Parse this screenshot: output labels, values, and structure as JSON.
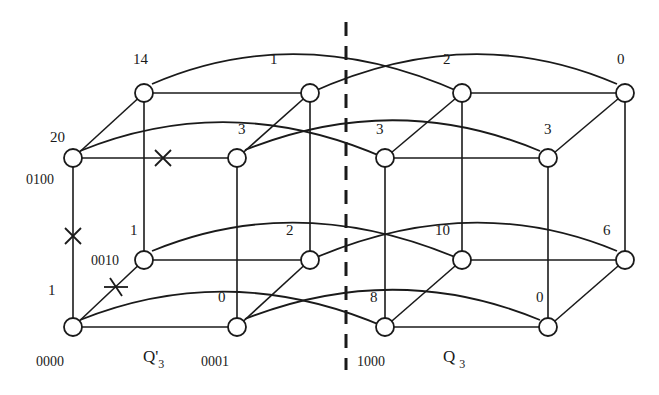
{
  "diagram": {
    "cubes": [
      {
        "label": "Q'",
        "subscript": "3"
      },
      {
        "label": "Q",
        "subscript": "3"
      }
    ],
    "node_values": {
      "back_top": [
        "14",
        "1",
        "2",
        "0"
      ],
      "front_top": [
        "20",
        "3",
        "3",
        "3"
      ],
      "back_bottom": [
        "1",
        "2",
        "10",
        "6"
      ],
      "front_bottom": [
        "1",
        "0",
        "8",
        "0"
      ]
    },
    "addresses": {
      "n0100": "0100",
      "n0010": "0010",
      "n0000": "0000",
      "n0001": "0001",
      "n1000": "1000"
    },
    "faulty_links": [
      "0100-0101",
      "0000-0100",
      "0000-0010"
    ],
    "cut_line": "dashed vertical separator between Q'3 and Q3"
  }
}
